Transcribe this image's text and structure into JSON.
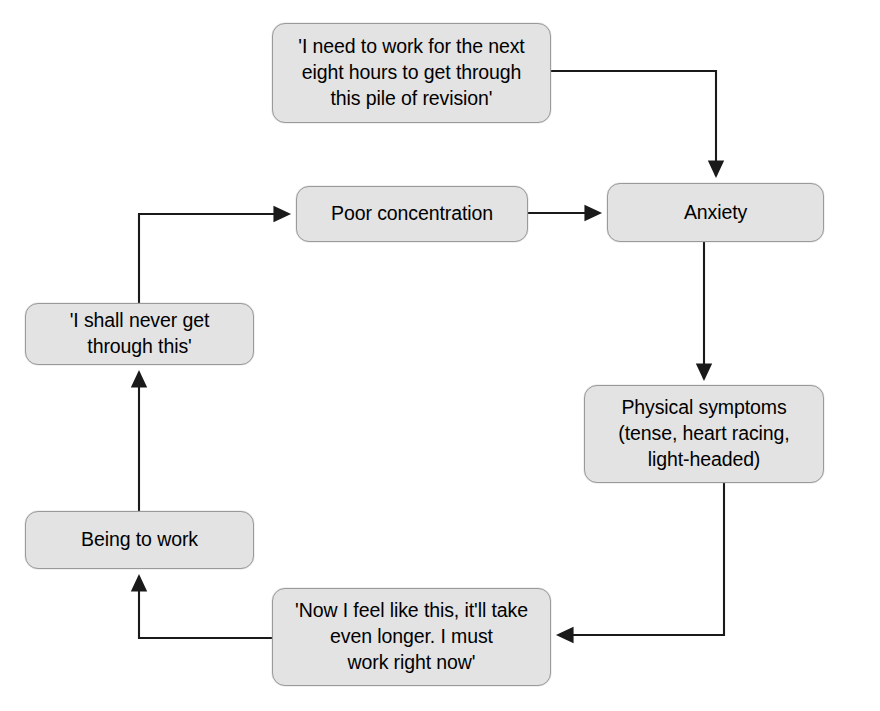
{
  "diagram": {
    "type": "flowchart",
    "style": {
      "node_fill": "#e3e3e3",
      "node_border": "#9a9a9a",
      "connector_color": "#1a1a1a",
      "background": "#ffffff",
      "text_color": "#000000"
    },
    "nodes": [
      {
        "id": "trigger-thought",
        "label": "'I need to work for the next eight hours to get through this pile of revision'",
        "shape": "rounded-rectangle"
      },
      {
        "id": "poor-concentration",
        "label": "Poor concentration",
        "shape": "rounded-rectangle"
      },
      {
        "id": "anxiety",
        "label": "Anxiety",
        "shape": "rounded-rectangle"
      },
      {
        "id": "physical-symptoms",
        "label": "Physical symptoms (tense, heart racing, light-headed)",
        "shape": "rounded-rectangle"
      },
      {
        "id": "negative-thought",
        "label": "'I shall never get through this'",
        "shape": "rounded-rectangle"
      },
      {
        "id": "being-to-work",
        "label": "Being to work",
        "shape": "rounded-rectangle"
      },
      {
        "id": "urgency-thought",
        "label": "'Now I feel like this, it'll take even longer. I must work right now'",
        "shape": "rounded-rectangle"
      }
    ],
    "edges": [
      {
        "from": "trigger-thought",
        "to": "anxiety",
        "route": "right-down",
        "arrow": "down"
      },
      {
        "from": "poor-concentration",
        "to": "anxiety",
        "route": "straight-right",
        "arrow": "right"
      },
      {
        "from": "anxiety",
        "to": "physical-symptoms",
        "route": "straight-down",
        "arrow": "down"
      },
      {
        "from": "physical-symptoms",
        "to": "urgency-thought",
        "route": "down-left",
        "arrow": "left"
      },
      {
        "from": "urgency-thought",
        "to": "being-to-work",
        "route": "left-up",
        "arrow": "up"
      },
      {
        "from": "being-to-work",
        "to": "negative-thought",
        "route": "straight-up",
        "arrow": "up"
      },
      {
        "from": "negative-thought",
        "to": "poor-concentration",
        "route": "up-right",
        "arrow": "right"
      }
    ]
  },
  "labels": {
    "trigger_thought": "'I need to work for the next\neight hours to get through\nthis pile of revision'",
    "poor_concentration": "Poor concentration",
    "anxiety": "Anxiety",
    "physical_symptoms": "Physical symptoms\n(tense, heart racing,\nlight-headed)",
    "negative_thought": "'I shall never get\nthrough this'",
    "being_to_work": "Being to work",
    "urgency_thought": "'Now I feel like this, it'll take\neven longer. I must\nwork right now'"
  }
}
